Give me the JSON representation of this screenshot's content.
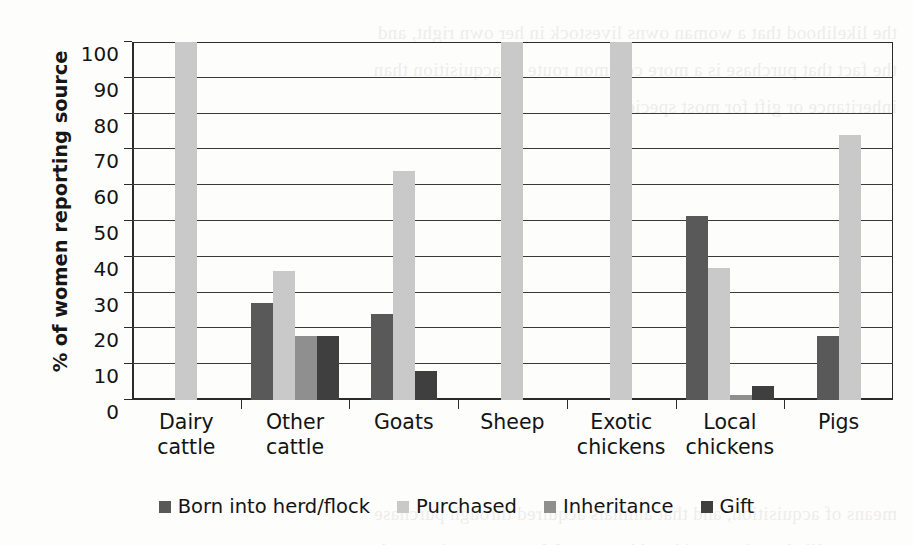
{
  "chart_data": {
    "type": "bar",
    "title": "",
    "xlabel": "",
    "ylabel": "% of women reporting source",
    "ylim": [
      0,
      100
    ],
    "ytick_step": 10,
    "yticks": [
      "0",
      "10",
      "20",
      "30",
      "40",
      "50",
      "60",
      "70",
      "80",
      "90",
      "100"
    ],
    "grid": true,
    "legend_position": "bottom",
    "categories": [
      "Dairy\ncattle",
      "Other\ncattle",
      "Goats",
      "Sheep",
      "Exotic\nchickens",
      "Local\nchickens",
      "Pigs"
    ],
    "categories_flat": [
      "Dairy cattle",
      "Other cattle",
      "Goats",
      "Sheep",
      "Exotic chickens",
      "Local chickens",
      "Pigs"
    ],
    "series": [
      {
        "name": "Born into herd/flock",
        "color": "#595959",
        "values": [
          0,
          27,
          24,
          0,
          0,
          51.5,
          18
        ]
      },
      {
        "name": "Purchased",
        "color": "#c9c9c9",
        "values": [
          100,
          36,
          64,
          100,
          100,
          37,
          74
        ]
      },
      {
        "name": "Inheritance",
        "color": "#8f8f8f",
        "values": [
          0,
          18,
          0,
          0,
          0,
          1.5,
          0
        ]
      },
      {
        "name": "Gift",
        "color": "#3f3f3f",
        "values": [
          0,
          18,
          8,
          0,
          0,
          4,
          0
        ]
      }
    ]
  },
  "legend": {
    "items": [
      {
        "label": "Born into herd/flock",
        "color": "#595959"
      },
      {
        "label": "Purchased",
        "color": "#c9c9c9"
      },
      {
        "label": "Inheritance",
        "color": "#8f8f8f"
      },
      {
        "label": "Gift",
        "color": "#3f3f3f"
      }
    ]
  },
  "background_text": "the likelihood that a woman owns livestock in her own right, and\nthe fact that purchase is a more common route of acquisition than\ninheritance or gift for most species.\n\n\n\n\n\n\n\n\n\n\nmeans of acquisition, and that animals acquired through purchase\nare more likely to be considered her own. Women reporting on the\nhousehold herd indicated that animals entered the herd chiefly by"
}
